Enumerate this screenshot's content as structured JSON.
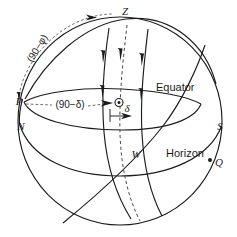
{
  "figure": {
    "background_color": "#ffffff",
    "line_color": "#1c1c1c",
    "dashed_line_color": "#4a4a4a"
  },
  "labels": {
    "zenith": "Z",
    "pole": "P",
    "north": "N",
    "south": "S",
    "west": "W",
    "point_q": "Q",
    "equator": "Equator",
    "horizon": "Horizon",
    "colatitude": "(90−φ)",
    "polar_distance": "(90−δ)",
    "declination": "δ"
  },
  "icons": {
    "star_object": "circled-dot-icon",
    "direction_arrow": "arrowhead-icon",
    "point_marker": "dot-marker-icon"
  },
  "annotations": [
    {
      "name": "zenith-point",
      "text": "Z",
      "x": 125,
      "y": 15
    },
    {
      "name": "celestial-pole-point",
      "text": "P",
      "x": 22,
      "y": 102
    },
    {
      "name": "north-point",
      "text": "N",
      "x": 24,
      "y": 126
    },
    {
      "name": "south-point",
      "text": "S",
      "x": 217,
      "y": 126
    },
    {
      "name": "west-point",
      "text": "W",
      "x": 135,
      "y": 154
    },
    {
      "name": "q-point",
      "text": "Q",
      "x": 216,
      "y": 163
    },
    {
      "name": "equator-label",
      "text": "Equator",
      "x": 158,
      "y": 88
    },
    {
      "name": "horizon-label",
      "text": "Horizon",
      "x": 168,
      "y": 154
    },
    {
      "name": "colatitude-label",
      "text": "(90−φ)",
      "x": 40,
      "y": 48
    },
    {
      "name": "polar-distance-label",
      "text": "(90−δ)",
      "x": 53,
      "y": 105
    },
    {
      "name": "declination-label",
      "text": "δ",
      "x": 127,
      "y": 118
    }
  ]
}
